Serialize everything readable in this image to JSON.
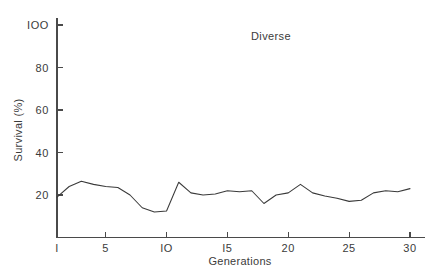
{
  "figure": {
    "background_color": "#ffffff",
    "line_color": "#3a3a3a",
    "axis_color": "#4a4a4a",
    "text_color": "#3b3b3b"
  },
  "chart_data": {
    "type": "line",
    "title": "Diverse",
    "xlabel": "Generations",
    "ylabel": "Survival (%)",
    "xlim": [
      1,
      30
    ],
    "ylim": [
      0,
      105
    ],
    "grid": false,
    "legend": null,
    "xticks": [
      1,
      5,
      10,
      15,
      20,
      25,
      30
    ],
    "xtick_labels": [
      "I",
      "5",
      "IO",
      "I5",
      "20",
      "25",
      "30"
    ],
    "yticks": [
      20,
      40,
      60,
      80,
      100
    ],
    "ytick_labels": [
      "20",
      "40",
      "60",
      "80",
      "IOO"
    ],
    "x": [
      1,
      2,
      3,
      4,
      5,
      6,
      7,
      8,
      9,
      10,
      11,
      12,
      13,
      14,
      15,
      16,
      17,
      18,
      19,
      20,
      21,
      22,
      23,
      24,
      25,
      26,
      27,
      28,
      29,
      30
    ],
    "values": [
      19,
      24,
      26.5,
      25,
      24,
      23.5,
      20,
      14,
      12,
      12.5,
      26,
      21,
      20,
      20.5,
      22,
      21.5,
      22,
      16,
      20,
      21,
      25,
      21,
      19.5,
      18.5,
      17,
      17.5,
      21,
      22,
      21.5,
      23
    ],
    "series": [
      {
        "name": "Diverse",
        "values": [
          19,
          24,
          26.5,
          25,
          24,
          23.5,
          20,
          14,
          12,
          12.5,
          26,
          21,
          20,
          20.5,
          22,
          21.5,
          22,
          16,
          20,
          21,
          25,
          21,
          19.5,
          18.5,
          17,
          17.5,
          21,
          22,
          21.5,
          23
        ]
      }
    ]
  }
}
